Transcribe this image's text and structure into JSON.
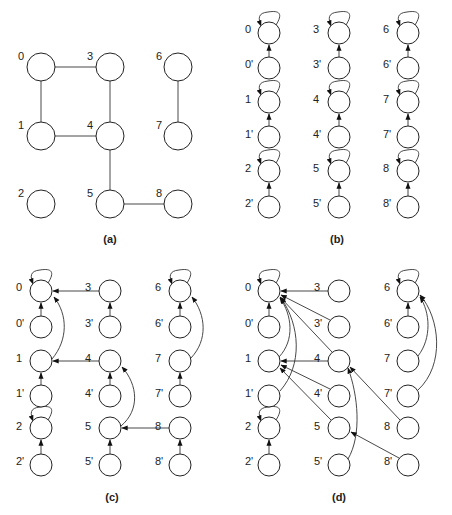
{
  "panels": {
    "a": {
      "caption": "(a)",
      "labels": [
        "0",
        "1",
        "2",
        "3",
        "4",
        "5",
        "6",
        "7",
        "8"
      ],
      "edges": [
        [
          "0",
          "3"
        ],
        [
          "0",
          "1"
        ],
        [
          "3",
          "4"
        ],
        [
          "1",
          "4"
        ],
        [
          "4",
          "5"
        ],
        [
          "5",
          "8"
        ],
        [
          "6",
          "7"
        ]
      ]
    },
    "b": {
      "caption": "(b)",
      "labels": [
        "0",
        "0'",
        "1",
        "1'",
        "2",
        "2'",
        "3",
        "3'",
        "4",
        "4'",
        "5",
        "5'",
        "6",
        "6'",
        "7",
        "7'",
        "8",
        "8'"
      ],
      "self_loops": [
        "0",
        "1",
        "2",
        "3",
        "4",
        "5",
        "6",
        "7",
        "8"
      ],
      "edges": [
        [
          "0'",
          "0"
        ],
        [
          "1'",
          "1"
        ],
        [
          "2'",
          "2"
        ],
        [
          "3'",
          "3"
        ],
        [
          "4'",
          "4"
        ],
        [
          "5'",
          "5"
        ],
        [
          "6'",
          "6"
        ],
        [
          "7'",
          "7"
        ],
        [
          "8'",
          "8"
        ]
      ]
    },
    "c": {
      "caption": "(c)",
      "labels": [
        "0",
        "0'",
        "1",
        "1'",
        "2",
        "2'",
        "3",
        "3'",
        "4",
        "4'",
        "5",
        "5'",
        "6",
        "6'",
        "7",
        "7'",
        "8",
        "8'"
      ],
      "self_loops": [
        "0",
        "2",
        "6"
      ],
      "edges": [
        [
          "0'",
          "0"
        ],
        [
          "1'",
          "1"
        ],
        [
          "2'",
          "2"
        ],
        [
          "3'",
          "3"
        ],
        [
          "4'",
          "4"
        ],
        [
          "5'",
          "5"
        ],
        [
          "6'",
          "6"
        ],
        [
          "7'",
          "7"
        ],
        [
          "8'",
          "8"
        ],
        [
          "3",
          "0"
        ],
        [
          "1",
          "0"
        ],
        [
          "4",
          "1"
        ],
        [
          "5",
          "4"
        ],
        [
          "8",
          "5"
        ],
        [
          "7",
          "6"
        ]
      ]
    },
    "d": {
      "caption": "(d)",
      "labels": [
        "0",
        "0'",
        "1",
        "1'",
        "2",
        "2'",
        "3",
        "3'",
        "4",
        "4'",
        "5",
        "5'",
        "6",
        "6'",
        "7",
        "7'",
        "8",
        "8'"
      ],
      "self_loops": [
        "0",
        "2",
        "6"
      ],
      "edges": [
        [
          "0'",
          "0"
        ],
        [
          "2'",
          "2"
        ],
        [
          "6'",
          "6"
        ],
        [
          "3",
          "0"
        ],
        [
          "3'",
          "0"
        ],
        [
          "4",
          "0"
        ],
        [
          "1",
          "0"
        ],
        [
          "1'",
          "0"
        ],
        [
          "4",
          "1"
        ],
        [
          "4'",
          "1"
        ],
        [
          "5",
          "1"
        ],
        [
          "5'",
          "4"
        ],
        [
          "8",
          "4"
        ],
        [
          "8'",
          "5"
        ],
        [
          "7",
          "6"
        ],
        [
          "7'",
          "6"
        ]
      ]
    }
  }
}
